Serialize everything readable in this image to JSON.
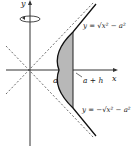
{
  "diagram": {
    "axis_x_label": "x",
    "axis_y_label": "y",
    "label_a": "a",
    "label_a_plus_h": "a + h",
    "upper_curve_label": "y = √x² − a²",
    "lower_curve_label": "y = −√x² − a²",
    "rotation_axis_icon": "rotation-arrow-icon",
    "shaded_color": "#b8b8b8"
  }
}
